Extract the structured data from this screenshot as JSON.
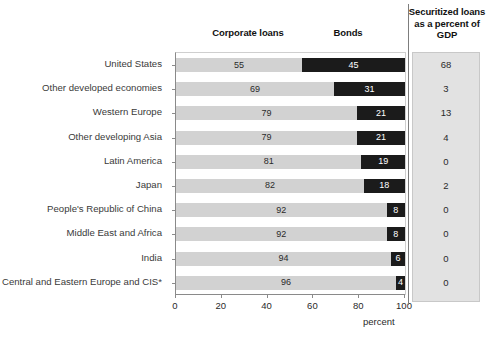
{
  "headers": {
    "corporate_loans": "Corporate loans",
    "bonds": "Bonds",
    "gdp": "Securitized loans as a percent of GDP"
  },
  "axis": {
    "ticks": [
      "0",
      "20",
      "40",
      "60",
      "80",
      "100"
    ],
    "unit_label": "percent"
  },
  "chart_data": {
    "type": "bar",
    "title": "",
    "subtitle": "",
    "xlabel": "percent",
    "ylabel": "",
    "xlim": [
      0,
      100
    ],
    "grid": false,
    "stacked": true,
    "orientation": "horizontal",
    "legend_position": "top",
    "categories": [
      "United States",
      "Other developed economies",
      "Western Europe",
      "Other developing Asia",
      "Latin America",
      "Japan",
      "People's Republic of China",
      "Middle East and Africa",
      "India",
      "Central and Eastern Europe and CIS*"
    ],
    "series": [
      {
        "name": "Corporate loans",
        "color": "#d2d2d2",
        "values": [
          55,
          69,
          79,
          79,
          81,
          82,
          92,
          92,
          94,
          96
        ]
      },
      {
        "name": "Bonds",
        "color": "#1b1b1b",
        "values": [
          45,
          31,
          21,
          21,
          19,
          18,
          8,
          8,
          6,
          4
        ]
      }
    ],
    "side_column": {
      "name": "Securitized loans as a percent of GDP",
      "values": [
        "68",
        "3",
        "13",
        "4",
        "0",
        "2",
        "0",
        "0",
        "0",
        "0"
      ]
    },
    "xticks": [
      0,
      20,
      40,
      60,
      80,
      100
    ],
    "xtick_labels": [
      "0",
      "20",
      "40",
      "60",
      "80",
      "100"
    ]
  }
}
